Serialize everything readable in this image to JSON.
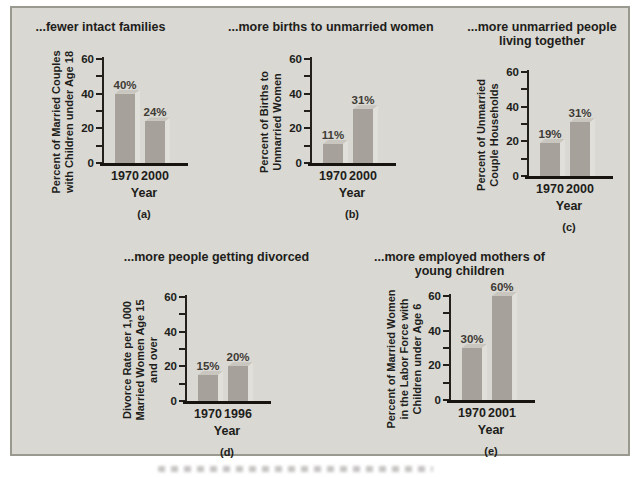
{
  "figure": {
    "panel_bg": "#d9d8d3",
    "panel_border": "#9a998f",
    "bar_front": "#a6a29b",
    "bar_top": "#c9c6bf",
    "bar_side": "#e1dfd9",
    "axis_color": "#23201c",
    "text_color": "#211d1a"
  },
  "chart_data": [
    {
      "type": "bar",
      "panel_label": "(a)",
      "title": "...fewer intact families",
      "title_lines": [
        "...fewer intact families"
      ],
      "ylabel": "Percent of Married Couples with Children under Age 18",
      "ylabel_lines": [
        "Percent of Married Couples",
        "with Children under Age 18"
      ],
      "xlabel": "Year",
      "categories": [
        "1970",
        "2000"
      ],
      "values": [
        40,
        24
      ],
      "value_labels": [
        "40%",
        "24%"
      ],
      "ylim": [
        0,
        60
      ],
      "yticks": [
        0,
        10,
        20,
        30,
        40,
        50,
        60
      ],
      "ytick_labels": [
        "60",
        "40",
        "20",
        "0"
      ],
      "ytick_label_values": [
        60,
        40,
        20,
        0
      ]
    },
    {
      "type": "bar",
      "panel_label": "(b)",
      "title": "...more births to unmarried women",
      "title_lines": [
        "...more births to unmarried women"
      ],
      "ylabel": "Percent of Births to Unmarried Women",
      "ylabel_lines": [
        "Percent of Births to",
        "Unmarried Women"
      ],
      "xlabel": "Year",
      "categories": [
        "1970",
        "2000"
      ],
      "values": [
        11,
        31
      ],
      "value_labels": [
        "11%",
        "31%"
      ],
      "ylim": [
        0,
        60
      ],
      "yticks": [
        0,
        10,
        20,
        30,
        40,
        50,
        60
      ],
      "ytick_labels": [
        "60",
        "40",
        "20",
        "0"
      ],
      "ytick_label_values": [
        60,
        40,
        20,
        0
      ]
    },
    {
      "type": "bar",
      "panel_label": "(c)",
      "title": "...more unmarried people living together",
      "title_lines": [
        "...more unmarried people",
        "living together"
      ],
      "ylabel": "Percent of Unmarried Couple Households",
      "ylabel_lines": [
        "Percent of Unmarried",
        "Couple Households"
      ],
      "xlabel": "Year",
      "categories": [
        "1970",
        "2000"
      ],
      "values": [
        19,
        31
      ],
      "value_labels": [
        "19%",
        "31%"
      ],
      "ylim": [
        0,
        60
      ],
      "yticks": [
        0,
        10,
        20,
        30,
        40,
        50,
        60
      ],
      "ytick_labels": [
        "60",
        "40",
        "20",
        "0"
      ],
      "ytick_label_values": [
        60,
        40,
        20,
        0
      ]
    },
    {
      "type": "bar",
      "panel_label": "(d)",
      "title": "...more people getting divorced",
      "title_lines": [
        "...more people getting divorced"
      ],
      "ylabel": "Divorce Rate per 1,000 Married Women Age 15 and over",
      "ylabel_lines": [
        "Divorce Rate per 1,000",
        "Married Women Age 15",
        "and over"
      ],
      "xlabel": "Year",
      "categories": [
        "1970",
        "1996"
      ],
      "values": [
        15,
        20
      ],
      "value_labels": [
        "15%",
        "20%"
      ],
      "ylim": [
        0,
        60
      ],
      "yticks": [
        0,
        10,
        20,
        30,
        40,
        50,
        60
      ],
      "ytick_labels": [
        "60",
        "40",
        "20",
        "0"
      ],
      "ytick_label_values": [
        60,
        40,
        20,
        0
      ]
    },
    {
      "type": "bar",
      "panel_label": "(e)",
      "title": "...more employed mothers of young children",
      "title_lines": [
        "...more employed mothers of",
        "young children"
      ],
      "ylabel": "Percent of Married Women in the Labor Force with Children under Age 6",
      "ylabel_lines": [
        "Percent of Married Women",
        "in the Labor Force with",
        "Children under Age 6"
      ],
      "xlabel": "Year",
      "categories": [
        "1970",
        "2001"
      ],
      "values": [
        30,
        60
      ],
      "value_labels": [
        "30%",
        "60%"
      ],
      "ylim": [
        0,
        60
      ],
      "yticks": [
        0,
        10,
        20,
        30,
        40,
        50,
        60
      ],
      "ytick_labels": [
        "60",
        "40",
        "20",
        "0"
      ],
      "ytick_label_values": [
        60,
        40,
        20,
        0
      ]
    }
  ]
}
